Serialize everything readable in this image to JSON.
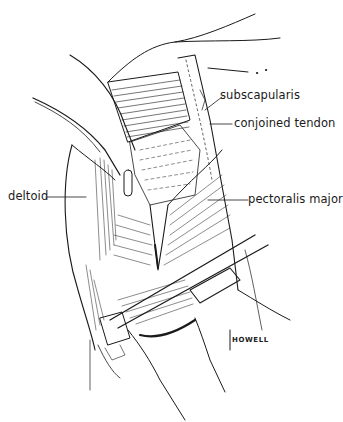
{
  "figure": {
    "type": "anatomical illustration",
    "colors": {
      "ink": "#1a1a1a",
      "background": "#ffffff"
    },
    "labels": [
      {
        "id": "subscapularis",
        "text": "subscapularis"
      },
      {
        "id": "conjoined_tendon",
        "text": "conjoined tendon"
      },
      {
        "id": "deltoid",
        "text": "deltoid"
      },
      {
        "id": "pectoralis_major",
        "text": "pectoralis major"
      }
    ],
    "signature": "HOWELL"
  }
}
